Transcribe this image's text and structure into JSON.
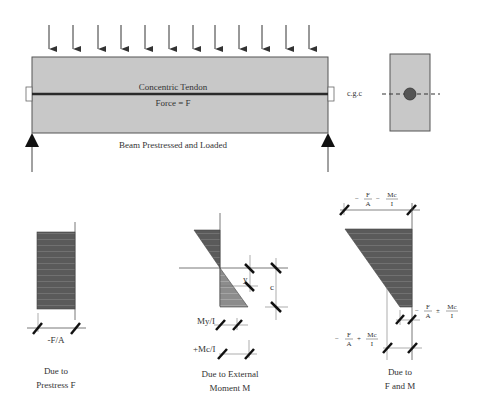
{
  "beam": {
    "tendon_label": "Concentric Tendon",
    "force_label": "Force = F",
    "caption": "Beam Prestressed and Loaded",
    "load_arrow_count": 12,
    "fill_color": "#c8c8c8",
    "tendon_color": "#2a2a2a"
  },
  "cross_section": {
    "cgc_label": "c.g.c",
    "fill_color": "#c8c8c8",
    "tendon_dot_color": "#555555"
  },
  "diagrams": [
    {
      "id": "prestress",
      "dimension_label": "-F/A",
      "caption_line1": "Due to",
      "caption_line2": "Prestress F",
      "fill_color": "#5a5a5a"
    },
    {
      "id": "external-moment",
      "y_label": "y",
      "c_label": "c",
      "my_label": "My/I",
      "mc_label": "+Mc/I",
      "caption_line1": "Due to External",
      "caption_line2": "Moment M",
      "top_fill_color": "#5a5a5a",
      "bottom_fill_color": "#8c8c8c"
    },
    {
      "id": "combined",
      "top_label": {
        "sign1": "−",
        "num1": "F",
        "den1": "A",
        "sign2": "−",
        "num2": "Mc",
        "den2": "I"
      },
      "right_label": {
        "sign1": "−",
        "num1": "F",
        "den1": "A",
        "sign2": "±",
        "num2": "Mc",
        "den2": "I"
      },
      "bottom_label": {
        "sign1": "−",
        "num1": "F",
        "den1": "A",
        "sign2": "+",
        "num2": "Mc",
        "den2": "I"
      },
      "caption_line1": "Due to",
      "caption_line2": "F and M",
      "fill_color": "#5a5a5a"
    }
  ]
}
